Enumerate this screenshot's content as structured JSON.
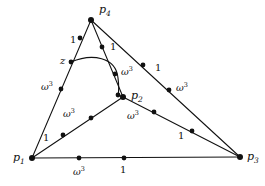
{
  "figure": {
    "kind": "geometric-graph-diagram",
    "width": 265,
    "height": 186,
    "background_color": "#ffffff",
    "ink_color": "#111111"
  },
  "vertices": [
    {
      "id": "p4",
      "label": "p",
      "sub": "4",
      "x": 91,
      "y": 20,
      "label_x": 99,
      "label_y": 4
    },
    {
      "id": "p2",
      "label": "p",
      "sub": "2",
      "x": 123,
      "y": 97,
      "label_x": 131,
      "label_y": 90
    },
    {
      "id": "p1",
      "label": "p",
      "sub": "1",
      "x": 32,
      "y": 158,
      "label_x": 13,
      "label_y": 152
    },
    {
      "id": "p3",
      "label": "p",
      "sub": "3",
      "x": 240,
      "y": 157,
      "label_x": 247,
      "label_y": 151
    }
  ],
  "marker_nodes": [
    {
      "edge": "p4-p1-outer",
      "x": 80,
      "y": 38
    },
    {
      "edge": "p4-p1-outer",
      "x": 71,
      "y": 62
    },
    {
      "edge": "p4-p1-outer",
      "x": 61,
      "y": 89
    },
    {
      "edge": "p4-p2-inner",
      "x": 102,
      "y": 47
    },
    {
      "edge": "p4-p2-inner",
      "x": 115,
      "y": 74
    },
    {
      "edge": "p4-p3-outer",
      "x": 143,
      "y": 65
    },
    {
      "edge": "p4-p3-outer",
      "x": 169,
      "y": 90
    },
    {
      "edge": "p1-p2-inner",
      "x": 63,
      "y": 135
    },
    {
      "edge": "p1-p2-inner",
      "x": 91,
      "y": 118
    },
    {
      "edge": "p2-p3-inner",
      "x": 154,
      "y": 112
    },
    {
      "edge": "p2-p3-inner",
      "x": 192,
      "y": 131
    },
    {
      "edge": "p1-p3-base",
      "x": 79,
      "y": 158
    },
    {
      "edge": "p1-p3-base",
      "x": 124,
      "y": 158
    },
    {
      "edge": "arc-end",
      "x": 118,
      "y": 95
    }
  ],
  "edge_labels": [
    {
      "id": "p4p1-1",
      "text": "1",
      "type": "weight",
      "x": 70,
      "y": 35
    },
    {
      "id": "p4p1-z",
      "text": "z",
      "type": "z",
      "x": 60,
      "y": 56
    },
    {
      "id": "p4p1-w3",
      "text": "ω",
      "sup": "3",
      "type": "omega",
      "x": 41,
      "y": 81
    },
    {
      "id": "p4p1-1b",
      "text": "1",
      "type": "weight",
      "x": 43,
      "y": 133
    },
    {
      "id": "p4p2-1",
      "text": "1",
      "type": "weight",
      "x": 110,
      "y": 42
    },
    {
      "id": "p4p2-w3",
      "text": "ω",
      "sup": "3",
      "type": "omega",
      "x": 121,
      "y": 66
    },
    {
      "id": "p4p3-1",
      "text": "1",
      "type": "weight",
      "x": 155,
      "y": 63
    },
    {
      "id": "p4p3-w3",
      "text": "ω",
      "sup": "3",
      "type": "omega",
      "x": 176,
      "y": 82
    },
    {
      "id": "p1p2-w3",
      "text": "ω",
      "sup": "3",
      "type": "omega",
      "x": 63,
      "y": 108
    },
    {
      "id": "p2p3-w3",
      "text": "ω",
      "sup": "3",
      "type": "omega",
      "x": 127,
      "y": 110
    },
    {
      "id": "p2p3-1",
      "text": "1",
      "type": "weight",
      "x": 178,
      "y": 131
    },
    {
      "id": "base-w3",
      "text": "ω",
      "sup": "3",
      "type": "omega",
      "x": 73,
      "y": 166
    },
    {
      "id": "base-1",
      "text": "1",
      "type": "weight",
      "x": 120,
      "y": 165
    }
  ],
  "edges": [
    {
      "id": "p4-p1-outer",
      "from": "p4",
      "to": "p1",
      "path": "M 91 20 L 32 158"
    },
    {
      "id": "p4-p2-inner",
      "from": "p4",
      "to": "p2",
      "path": "M 91 20 L 123 97"
    },
    {
      "id": "p4-p3-outer",
      "from": "p4",
      "to": "p3",
      "path": "M 91 20 L 240 157"
    },
    {
      "id": "p1-p2-inner",
      "from": "p1",
      "to": "p2",
      "path": "M 32 158 L 123 97"
    },
    {
      "id": "p2-p3-inner",
      "from": "p2",
      "to": "p3",
      "path": "M 123 97 L 240 157"
    },
    {
      "id": "p1-p3-base",
      "from": "p1",
      "to": "p3",
      "path": "M 32 158 L 240 157"
    },
    {
      "id": "arc-z-p2",
      "from": "z",
      "to": "p2",
      "path": "M 71 62 C 92 53 116 57 118 78 C 119 86 119 91 118 95 L 123 97"
    }
  ]
}
